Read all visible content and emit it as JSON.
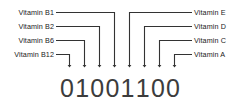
{
  "diagram": {
    "line_color": "#333333",
    "digit_color": "#3c3c3c",
    "label_color": "#1a1a1a",
    "bit_string": "01001100",
    "left_labels": [
      {
        "text": "Vitamin B1",
        "bit_index": 3,
        "bit_value": "0"
      },
      {
        "text": "Vitamin B2",
        "bit_index": 2,
        "bit_value": "0"
      },
      {
        "text": "Vitamin B6",
        "bit_index": 1,
        "bit_value": "1"
      },
      {
        "text": "Vitamin B12",
        "bit_index": 0,
        "bit_value": "0"
      }
    ],
    "right_labels": [
      {
        "text": "Vitamin E",
        "bit_index": 4,
        "bit_value": "1"
      },
      {
        "text": "Vitamin D",
        "bit_index": 5,
        "bit_value": "1"
      },
      {
        "text": "Vitamin C",
        "bit_index": 6,
        "bit_value": "0"
      },
      {
        "text": "Vitamin A",
        "bit_index": 7,
        "bit_value": "0"
      }
    ],
    "bits": [
      {
        "value": "0"
      },
      {
        "value": "1"
      },
      {
        "value": "0"
      },
      {
        "value": "0"
      },
      {
        "value": "1"
      },
      {
        "value": "1"
      },
      {
        "value": "0"
      },
      {
        "value": "0"
      }
    ]
  }
}
